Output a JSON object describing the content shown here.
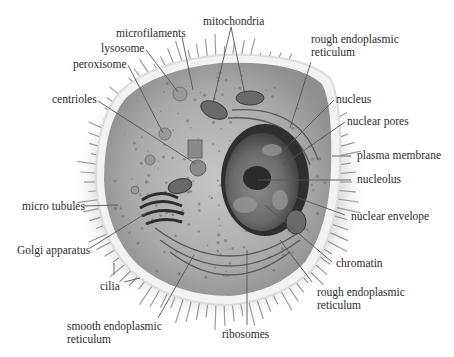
{
  "diagram": {
    "type": "labeled-illustration",
    "labels": [
      {
        "id": "microfilaments",
        "text": "microfilaments",
        "x": 116,
        "y": 27
      },
      {
        "id": "mitochondria",
        "text": "mitochondria",
        "x": 203,
        "y": 15
      },
      {
        "id": "lysosome",
        "text": "lysosome",
        "x": 101,
        "y": 42
      },
      {
        "id": "peroxisome",
        "text": "peroxisome",
        "x": 73,
        "y": 58
      },
      {
        "id": "rough-er-top",
        "text": "rough endoplasmic\nreticulum",
        "x": 311,
        "y": 33
      },
      {
        "id": "centrioles",
        "text": "centrioles",
        "x": 52,
        "y": 93
      },
      {
        "id": "nucleus",
        "text": "nucleus",
        "x": 336,
        "y": 93
      },
      {
        "id": "nuclear-pores",
        "text": "nuclear pores",
        "x": 347,
        "y": 115
      },
      {
        "id": "plasma-membrane",
        "text": "plasma membrane",
        "x": 357,
        "y": 149
      },
      {
        "id": "nucleolus",
        "text": "nucleolus",
        "x": 357,
        "y": 173
      },
      {
        "id": "micro-tubules",
        "text": "micro tubules",
        "x": 22,
        "y": 200
      },
      {
        "id": "nuclear-envelope",
        "text": "nuclear envelope",
        "x": 351,
        "y": 210
      },
      {
        "id": "golgi-apparatus",
        "text": "Golgi apparatus",
        "x": 17,
        "y": 244
      },
      {
        "id": "chromatin",
        "text": "chromatin",
        "x": 336,
        "y": 257
      },
      {
        "id": "cilia",
        "text": "cilia",
        "x": 100,
        "y": 280
      },
      {
        "id": "rough-er-bottom",
        "text": "rough endoplasmic\nreticulum",
        "x": 317,
        "y": 286
      },
      {
        "id": "smooth-er",
        "text": "smooth endoplasmic\nreticulum",
        "x": 67,
        "y": 320
      },
      {
        "id": "ribosomes",
        "text": "ribosomes",
        "x": 222,
        "y": 328
      }
    ],
    "leaders": [
      {
        "for": "microfilaments",
        "x1": 182,
        "y1": 37,
        "x2": 193,
        "y2": 90
      },
      {
        "for": "mitochondria-a",
        "x1": 231,
        "y1": 27,
        "x2": 213,
        "y2": 103
      },
      {
        "for": "mitochondria-b",
        "x1": 231,
        "y1": 27,
        "x2": 245,
        "y2": 95
      },
      {
        "for": "lysosome",
        "x1": 146,
        "y1": 50,
        "x2": 178,
        "y2": 92
      },
      {
        "for": "peroxisome",
        "x1": 128,
        "y1": 65,
        "x2": 163,
        "y2": 133
      },
      {
        "for": "rough-er-top",
        "x1": 311,
        "y1": 62,
        "x2": 290,
        "y2": 128
      },
      {
        "for": "centrioles",
        "x1": 98,
        "y1": 101,
        "x2": 196,
        "y2": 164
      },
      {
        "for": "nucleus",
        "x1": 334,
        "y1": 100,
        "x2": 282,
        "y2": 152
      },
      {
        "for": "nuclear-pores",
        "x1": 345,
        "y1": 122,
        "x2": 283,
        "y2": 165
      },
      {
        "for": "plasma-membrane",
        "x1": 351,
        "y1": 156,
        "x2": 332,
        "y2": 156
      },
      {
        "for": "nucleolus",
        "x1": 351,
        "y1": 180,
        "x2": 258,
        "y2": 180
      },
      {
        "for": "micro-tubules",
        "x1": 83,
        "y1": 206,
        "x2": 118,
        "y2": 205
      },
      {
        "for": "nuclear-envelope",
        "x1": 345,
        "y1": 215,
        "x2": 293,
        "y2": 196
      },
      {
        "for": "golgi-apparatus",
        "x1": 90,
        "y1": 248,
        "x2": 148,
        "y2": 212
      },
      {
        "for": "chromatin",
        "x1": 332,
        "y1": 262,
        "x2": 265,
        "y2": 205
      },
      {
        "for": "cilia",
        "x1": 124,
        "y1": 282,
        "x2": 140,
        "y2": 278
      },
      {
        "for": "cilia-2",
        "x1": 114,
        "y1": 263,
        "x2": 114,
        "y2": 275
      },
      {
        "for": "rough-er-bottom",
        "x1": 312,
        "y1": 282,
        "x2": 280,
        "y2": 240
      },
      {
        "for": "smooth-er",
        "x1": 158,
        "y1": 318,
        "x2": 194,
        "y2": 255
      },
      {
        "for": "ribosomes",
        "x1": 247,
        "y1": 325,
        "x2": 247,
        "y2": 250
      }
    ]
  },
  "colors": {
    "background": "#ffffff",
    "label_text": "#2b2b2b",
    "leader_line": "#555555",
    "cytoplasm": "#b7b7b7",
    "membrane": "#eeeeee",
    "nucleus": "#5a5a5a",
    "cilia": "#8a8a8a"
  }
}
